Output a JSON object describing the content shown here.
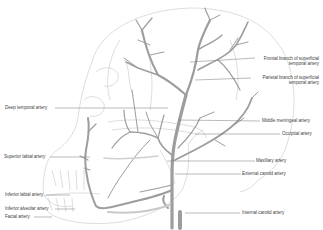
{
  "diagram": {
    "labels_right": [
      {
        "id": "frontal",
        "lines": [
          "Frontal branch of superficial",
          "temporal artery"
        ]
      },
      {
        "id": "parietal",
        "lines": [
          "Parietal branch of superficial",
          "temporal artery"
        ]
      },
      {
        "id": "middle_meningeal",
        "lines": [
          "Middle meningeal artery"
        ]
      },
      {
        "id": "occipital",
        "lines": [
          "Occipital artery"
        ]
      },
      {
        "id": "maxillary",
        "lines": [
          "Maxillary artery"
        ]
      },
      {
        "id": "external_carotid",
        "lines": [
          "External carotid artery"
        ]
      },
      {
        "id": "internal_carotid",
        "lines": [
          "Internal carotid artery"
        ]
      }
    ],
    "labels_left": [
      {
        "id": "deep_temporal",
        "lines": [
          "Deep temporal artery"
        ]
      },
      {
        "id": "superior_labial",
        "lines": [
          "Superior labial artery"
        ]
      },
      {
        "id": "inferior_labial",
        "lines": [
          "Inferior labial artery"
        ]
      },
      {
        "id": "inferior_alveolar",
        "lines": [
          "Inferior alveolar artery"
        ]
      },
      {
        "id": "facial",
        "lines": [
          "Facial artery"
        ]
      }
    ],
    "colors": {
      "artery": "#9a9a9a",
      "skull_outline": "#c8c8c8",
      "leader_line": "#666666",
      "label_text": "#444444",
      "background": "#ffffff"
    }
  }
}
